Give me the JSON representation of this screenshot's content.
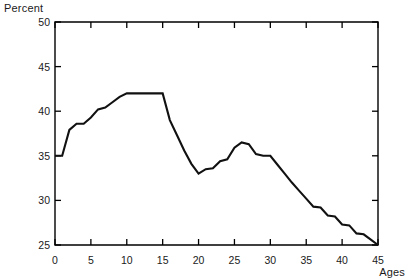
{
  "chart_data": {
    "type": "line",
    "title": "",
    "xlabel": "Ages",
    "ylabel": "Percent",
    "xlim": [
      0,
      45
    ],
    "ylim": [
      25,
      50
    ],
    "grid": false,
    "legend": null,
    "x_ticks": [
      0,
      5,
      10,
      15,
      20,
      25,
      30,
      35,
      40,
      45
    ],
    "x_tick_labels": [
      "0",
      "5",
      "10",
      "15",
      "20",
      "25",
      "30",
      "35",
      "40",
      "45"
    ],
    "y_ticks": [
      25,
      30,
      35,
      40,
      45,
      50
    ],
    "y_tick_labels": [
      "25",
      "30",
      "35",
      "40",
      "45",
      "50"
    ],
    "x": [
      0,
      1,
      2,
      3,
      4,
      5,
      6,
      7,
      8,
      9,
      10,
      11,
      12,
      13,
      14,
      15,
      16,
      17,
      18,
      19,
      20,
      21,
      22,
      23,
      24,
      25,
      26,
      27,
      28,
      29,
      30,
      31,
      32,
      33,
      34,
      35,
      36,
      37,
      38,
      39,
      40,
      41,
      42,
      43,
      44,
      45
    ],
    "values": [
      35.0,
      35.0,
      37.9,
      38.6,
      38.6,
      39.3,
      40.2,
      40.4,
      41.0,
      41.6,
      42.0,
      42.0,
      42.0,
      42.0,
      42.0,
      42.0,
      39.0,
      37.3,
      35.6,
      34.1,
      33.0,
      33.5,
      33.6,
      34.4,
      34.6,
      35.9,
      36.5,
      36.3,
      35.2,
      35.0,
      35.0,
      34.0,
      33.0,
      32.0,
      31.1,
      30.2,
      29.3,
      29.2,
      28.3,
      28.2,
      27.3,
      27.2,
      26.3,
      26.2,
      25.6,
      25.0
    ],
    "series_name": "Percent",
    "line_color": "#111111",
    "background_color": "#ffffff",
    "annotations": []
  },
  "axes": {
    "y_axis_caption": "Percent",
    "x_axis_caption": "Ages"
  }
}
